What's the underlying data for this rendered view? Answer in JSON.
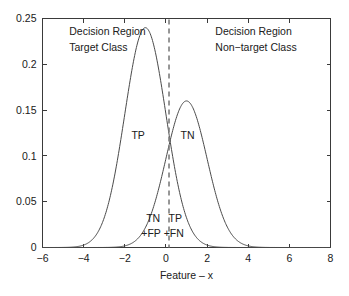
{
  "chart_data": {
    "type": "line",
    "title": "",
    "xlabel": "Feature – x",
    "ylabel": "",
    "xlim": [
      -6,
      8
    ],
    "ylim": [
      0,
      0.25
    ],
    "grid": false,
    "legend": "none",
    "xticks": [
      -6,
      -4,
      -2,
      0,
      2,
      4,
      6,
      8
    ],
    "xticklabels": [
      "−6",
      "−4",
      "−2",
      "0",
      "2",
      "4",
      "6",
      "8"
    ],
    "yticks": [
      0,
      0.05,
      0.1,
      0.15,
      0.2,
      0.25
    ],
    "yticklabels": [
      "0",
      "0.05",
      "0.1",
      "0.15",
      "0.2",
      "0.25"
    ],
    "series": [
      {
        "name": "Target Class",
        "distribution": "gaussian",
        "mean": -1.0,
        "sigma": 1.0,
        "peak": 0.24,
        "peak_x": -1.0
      },
      {
        "name": "Non-target Class",
        "distribution": "gaussian",
        "mean": 1.0,
        "sigma": 1.0,
        "peak": 0.16,
        "peak_x": 1.0
      }
    ],
    "threshold": {
      "x": 0.15,
      "style": "dashed",
      "label": "decision threshold"
    },
    "crossing_point": {
      "x": 0.15,
      "y": 0.117
    },
    "annotations": [
      {
        "id": "left-region",
        "text_line1": "Decision Region",
        "text_line2": "Target Class",
        "x": -4.7,
        "y": 0.232
      },
      {
        "id": "right-region",
        "text_line1": "Decision Region",
        "text_line2": "Non−target Class",
        "x": 2.4,
        "y": 0.232
      },
      {
        "id": "tp-curve",
        "text": "TP",
        "x": -1.35,
        "y": 0.118
      },
      {
        "id": "tn-curve",
        "text": "TN",
        "x": 1.05,
        "y": 0.118
      },
      {
        "id": "tn-fp-line1",
        "text": "TN",
        "x": -0.62,
        "y": 0.028
      },
      {
        "id": "tn-fp-line2",
        "text": "+FP",
        "x": -0.72,
        "y": 0.011
      },
      {
        "id": "tp-fn-line1",
        "text": "TP",
        "x": 0.45,
        "y": 0.028
      },
      {
        "id": "tp-fn-line2",
        "text": "+FN",
        "x": 0.38,
        "y": 0.011
      }
    ],
    "colors": {
      "background": "#ffffff",
      "axis": "#3a3a3a",
      "curve": "#4a4a4a",
      "threshold": "#7d7d7d",
      "text": "#202020"
    }
  }
}
